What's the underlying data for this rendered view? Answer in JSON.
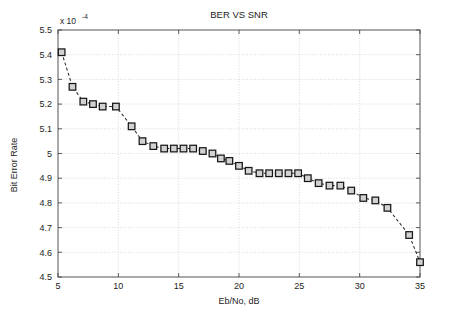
{
  "chart_data": {
    "type": "line",
    "title": "BER VS SNR",
    "xlabel": "Eb/No, dB",
    "ylabel": "Bit Error Rate",
    "y_multiplier_text": "x 10",
    "y_multiplier_exponent": "-4",
    "y_multiplier_value": 0.0001,
    "xlim": [
      5,
      35
    ],
    "ylim": [
      4.5,
      5.5
    ],
    "xticks": [
      5,
      10,
      15,
      20,
      25,
      30,
      35
    ],
    "xticklabels": [
      "5",
      "10",
      "15",
      "20",
      "25",
      "30",
      "35"
    ],
    "yticks": [
      4.5,
      4.6,
      4.7,
      4.8,
      4.9,
      5.0,
      5.1,
      5.2,
      5.3,
      5.4,
      5.5
    ],
    "yticklabels": [
      "4.5",
      "4.6",
      "4.7",
      "4.8",
      "4.9",
      "5",
      "5.1",
      "5.2",
      "5.3",
      "5.4",
      "5.5"
    ],
    "grid": true,
    "legend": null,
    "marker": "square",
    "linestyle": "dashed",
    "series": [
      {
        "name": "BER",
        "x": [
          5.3,
          6.2,
          7.1,
          7.9,
          8.7,
          9.8,
          11.1,
          12.0,
          12.9,
          13.8,
          14.6,
          15.4,
          16.2,
          17.0,
          17.8,
          18.5,
          19.2,
          20.0,
          20.8,
          21.7,
          22.5,
          23.3,
          24.1,
          24.9,
          25.7,
          26.6,
          27.5,
          28.4,
          29.3,
          30.3,
          31.3,
          32.3,
          34.1,
          35.0
        ],
        "y": [
          5.41,
          5.27,
          5.21,
          5.2,
          5.19,
          5.19,
          5.11,
          5.05,
          5.03,
          5.02,
          5.02,
          5.02,
          5.02,
          5.01,
          5.0,
          4.98,
          4.97,
          4.95,
          4.93,
          4.92,
          4.92,
          4.92,
          4.92,
          4.92,
          4.9,
          4.88,
          4.87,
          4.87,
          4.85,
          4.82,
          4.81,
          4.78,
          4.67,
          4.56
        ]
      }
    ]
  }
}
